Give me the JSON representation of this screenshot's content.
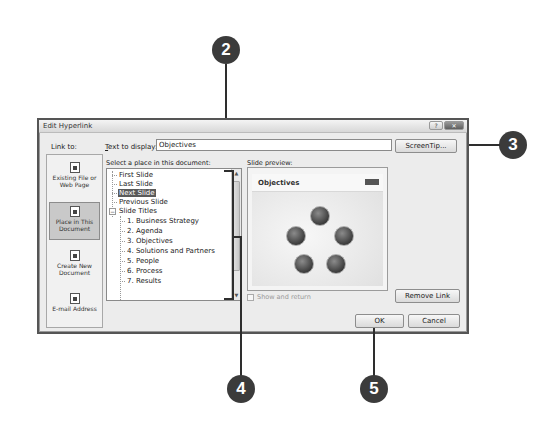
{
  "dialog": {
    "title": "Edit Hyperlink",
    "title_buttons": [
      "?",
      "✕"
    ],
    "link_to_label": "Link to:",
    "text_to_display_label_pre": "",
    "text_to_display_label_u": "T",
    "text_to_display_label_post": "ext to display:",
    "text_to_display_value": "Objectives",
    "screentip_label": "ScreenTip...",
    "sidebar": [
      {
        "label_line1": "Existing File or",
        "label_line2": "Web Page",
        "icon": "file-icon",
        "active": false
      },
      {
        "label_line1": "Place in This",
        "label_line2": "Document",
        "icon": "document-place-icon",
        "active": true
      },
      {
        "label_line1": "Create New",
        "label_line2": "Document",
        "icon": "new-document-icon",
        "active": false
      },
      {
        "label_line1": "E-mail Address",
        "label_line2": "",
        "icon": "email-icon",
        "active": false
      }
    ],
    "select_place_label": "Select a place in this document:",
    "tree": {
      "items": [
        {
          "label": "First Slide",
          "level": 0
        },
        {
          "label": "Last Slide",
          "level": 0
        },
        {
          "label": "Next Slide",
          "level": 0,
          "selected": true
        },
        {
          "label": "Previous Slide",
          "level": 0
        },
        {
          "label": "Slide Titles",
          "level": 0,
          "expander": "−"
        },
        {
          "label": "1. Business Strategy",
          "level": 1
        },
        {
          "label": "2. Agenda",
          "level": 1
        },
        {
          "label": "3. Objectives",
          "level": 1
        },
        {
          "label": "4. Solutions and Partners",
          "level": 1
        },
        {
          "label": "5. People",
          "level": 1
        },
        {
          "label": "6. Process",
          "level": 1
        },
        {
          "label": "7. Results",
          "level": 1
        }
      ]
    },
    "slide_preview_label": "Slide preview:",
    "slide_preview_title": "Objectives",
    "show_and_return_label": "Show and return",
    "remove_link_label": "Remove Link",
    "ok_label": "OK",
    "cancel_label": "Cancel"
  },
  "callouts": [
    "2",
    "3",
    "4",
    "5"
  ]
}
